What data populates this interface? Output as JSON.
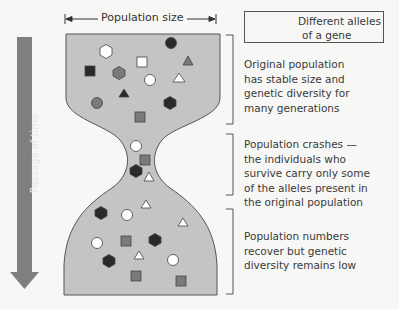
{
  "header": {
    "population_size_label": "Population size"
  },
  "legend": {
    "text_line1": "Different alleles",
    "text_line2": "of a gene",
    "swatches": [
      {
        "shape": "hexagon",
        "color": "#7a7a7a"
      },
      {
        "shape": "hexagon",
        "color": "#2a2a2a"
      },
      {
        "shape": "hexagon",
        "color": "#ffffff"
      }
    ]
  },
  "time_axis": {
    "label": "Passage of time",
    "arrow_color": "#7f7f7f"
  },
  "stages": [
    {
      "name": "original",
      "lines": [
        "Original population",
        "has stable size and",
        "genetic diversity for",
        "many generations"
      ]
    },
    {
      "name": "crash",
      "lines": [
        "Population crashes —",
        "the individuals who",
        "survive carry only some",
        "of the alleles present in",
        "the original population"
      ]
    },
    {
      "name": "recovery",
      "lines": [
        "Population numbers",
        "recover but genetic",
        "diversity remains low"
      ]
    }
  ],
  "colors": {
    "population_fill": "#c4c4c4",
    "outline": "#555555",
    "background": "#f7f7f5",
    "allele_mid_gray": "#7a7a7a",
    "allele_dark": "#2a2a2a",
    "allele_white": "#ffffff"
  }
}
